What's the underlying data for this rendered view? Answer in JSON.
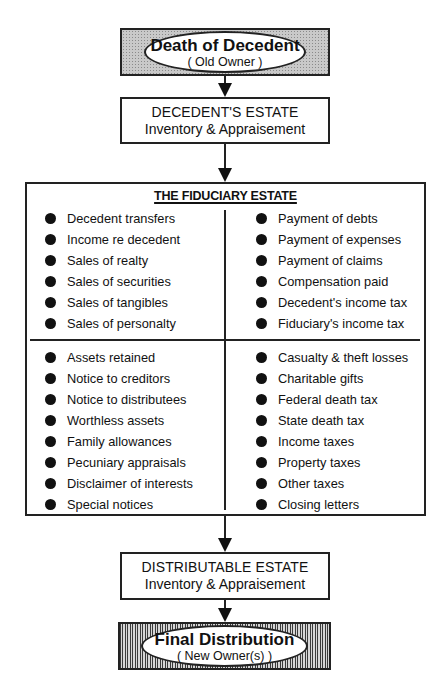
{
  "diagram": {
    "start": {
      "title": "Death of Decedent",
      "subtitle": "( Old Owner )"
    },
    "decedents_estate": {
      "line1": "DECEDENT'S ESTATE",
      "line2": "Inventory & Appraisement"
    },
    "fiduciary_estate": {
      "title": "THE FIDUCIARY ESTATE",
      "quadrants": {
        "top_left": [
          "Decedent transfers",
          "Income re decedent",
          "Sales of realty",
          "Sales of securities",
          "Sales of tangibles",
          "Sales of personalty"
        ],
        "top_right": [
          "Payment of debts",
          "Payment of expenses",
          "Payment of claims",
          "Compensation paid",
          "Decedent's income tax",
          "Fiduciary's income tax"
        ],
        "bottom_left": [
          "Assets retained",
          "Notice to creditors",
          "Notice to distributees",
          "Worthless assets",
          "Family allowances",
          "Pecuniary appraisals",
          "Disclaimer of interests",
          "Special notices"
        ],
        "bottom_right": [
          "Casualty & theft losses",
          "Charitable gifts",
          "Federal death tax",
          "State death tax",
          "Income taxes",
          "Property taxes",
          "Other taxes",
          "Closing letters"
        ]
      }
    },
    "distributable_estate": {
      "line1": "DISTRIBUTABLE ESTATE",
      "line2": "Inventory & Appraisement"
    },
    "end": {
      "title": "Final Distribution",
      "subtitle": "( New Owner(s) )"
    }
  }
}
